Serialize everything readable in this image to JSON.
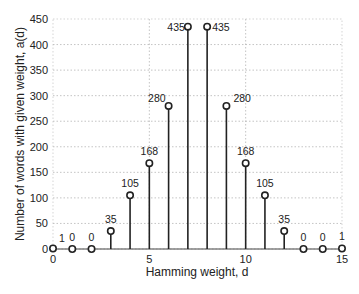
{
  "chart_data": {
    "type": "stem",
    "title": "",
    "xlabel": "Hamming weight, d",
    "ylabel": "Number of words with given weight, a(d)",
    "x": [
      0,
      1,
      2,
      3,
      4,
      5,
      6,
      7,
      8,
      9,
      10,
      11,
      12,
      13,
      14,
      15
    ],
    "values": [
      1,
      0,
      0,
      35,
      105,
      168,
      280,
      435,
      435,
      280,
      168,
      105,
      35,
      0,
      0,
      1
    ],
    "data_labels": [
      "1",
      "0",
      "0",
      "35",
      "105",
      "168",
      "280",
      "435",
      "435",
      "280",
      "168",
      "105",
      "35",
      "0",
      "0",
      "1"
    ],
    "xlim": [
      0,
      15
    ],
    "ylim": [
      0,
      450
    ],
    "xticks": [
      0,
      5,
      10,
      15
    ],
    "yticks": [
      0,
      50,
      100,
      150,
      200,
      250,
      300,
      350,
      400,
      450
    ],
    "grid": true,
    "legend": null
  }
}
